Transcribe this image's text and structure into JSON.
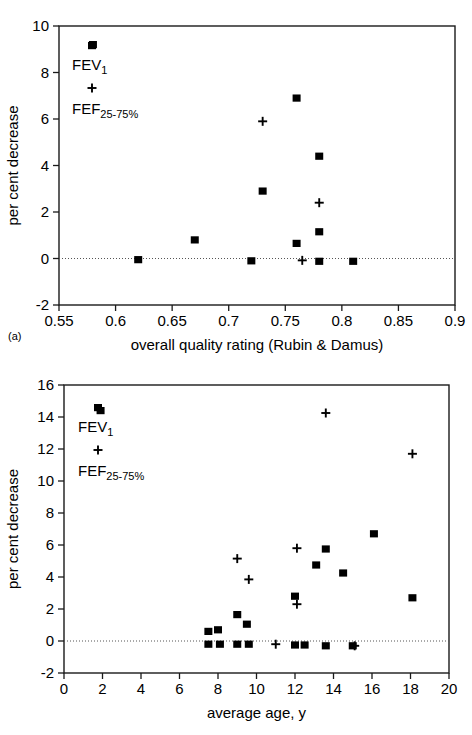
{
  "figure": {
    "panel_a_tag": "(a)",
    "panel_b_tag": "(b)"
  },
  "legend": {
    "series1_label": "FEV",
    "series1_sub": "1",
    "series2_label": "FEF",
    "series2_sub": "25-75%",
    "series1_marker": "filled-square",
    "series2_marker": "plus"
  },
  "chart_data": [
    {
      "type": "scatter",
      "panel": "(a)",
      "title": "",
      "xlabel": "overall quality rating (Rubin & Damus)",
      "ylabel": "per cent decrease",
      "xlim": [
        0.55,
        0.9
      ],
      "ylim": [
        -2,
        10
      ],
      "xticks": [
        0.55,
        0.6,
        0.65,
        0.7,
        0.75,
        0.8,
        0.85,
        0.9
      ],
      "xtick_labels": [
        "0.55",
        "0.6",
        "0.65",
        "0.7",
        "0.75",
        "0.8",
        "0.85",
        "0.9"
      ],
      "yticks": [
        -2,
        0,
        2,
        4,
        6,
        8,
        10
      ],
      "ytick_labels": [
        "-2",
        "0",
        "2",
        "4",
        "6",
        "8",
        "10"
      ],
      "grid": false,
      "zero_line": true,
      "legend_position": "top-left inside",
      "series": [
        {
          "name": "FEV1",
          "marker": "filled-square",
          "points": [
            {
              "x": 0.58,
              "y": 9.2
            },
            {
              "x": 0.62,
              "y": -0.05
            },
            {
              "x": 0.67,
              "y": 0.8
            },
            {
              "x": 0.72,
              "y": -0.1
            },
            {
              "x": 0.73,
              "y": 2.9
            },
            {
              "x": 0.76,
              "y": 6.9
            },
            {
              "x": 0.76,
              "y": 0.65
            },
            {
              "x": 0.78,
              "y": 4.4
            },
            {
              "x": 0.78,
              "y": 1.15
            },
            {
              "x": 0.78,
              "y": -0.12
            },
            {
              "x": 0.81,
              "y": -0.12
            }
          ]
        },
        {
          "name": "FEF25-75%",
          "marker": "plus",
          "points": [
            {
              "x": 0.73,
              "y": 5.9
            },
            {
              "x": 0.78,
              "y": 2.4
            },
            {
              "x": 0.765,
              "y": -0.08
            }
          ]
        }
      ]
    },
    {
      "type": "scatter",
      "panel": "(b)",
      "title": "",
      "xlabel": "average age, y",
      "ylabel": "per cent decrease",
      "xlim": [
        0,
        20
      ],
      "ylim": [
        -2,
        16
      ],
      "xticks": [
        0,
        2,
        4,
        6,
        8,
        10,
        12,
        14,
        16,
        18,
        20
      ],
      "xtick_labels": [
        "0",
        "2",
        "4",
        "6",
        "8",
        "10",
        "12",
        "14",
        "16",
        "18",
        "20"
      ],
      "yticks": [
        -2,
        0,
        2,
        4,
        6,
        8,
        10,
        12,
        14,
        16
      ],
      "ytick_labels": [
        "-2",
        "0",
        "2",
        "4",
        "6",
        "8",
        "10",
        "12",
        "14",
        "16"
      ],
      "grid": false,
      "zero_line": true,
      "legend_position": "top-left inside",
      "series": [
        {
          "name": "FEV1",
          "marker": "filled-square",
          "points": [
            {
              "x": 1.9,
              "y": 14.4
            },
            {
              "x": 7.5,
              "y": 0.6
            },
            {
              "x": 7.5,
              "y": -0.2
            },
            {
              "x": 8.0,
              "y": 0.7
            },
            {
              "x": 8.1,
              "y": -0.2
            },
            {
              "x": 9.0,
              "y": 1.65
            },
            {
              "x": 9.0,
              "y": -0.2
            },
            {
              "x": 9.5,
              "y": 1.05
            },
            {
              "x": 9.6,
              "y": -0.2
            },
            {
              "x": 12.0,
              "y": 2.8
            },
            {
              "x": 12.0,
              "y": -0.25
            },
            {
              "x": 12.5,
              "y": -0.25
            },
            {
              "x": 13.1,
              "y": 4.75
            },
            {
              "x": 13.6,
              "y": 5.75
            },
            {
              "x": 13.6,
              "y": -0.3
            },
            {
              "x": 14.5,
              "y": 4.25
            },
            {
              "x": 15.0,
              "y": -0.3
            },
            {
              "x": 16.1,
              "y": 6.7
            },
            {
              "x": 18.1,
              "y": 2.7
            }
          ]
        },
        {
          "name": "FEF25-75%",
          "marker": "plus",
          "points": [
            {
              "x": 9.0,
              "y": 5.15
            },
            {
              "x": 9.6,
              "y": 3.85
            },
            {
              "x": 11.0,
              "y": -0.2
            },
            {
              "x": 12.1,
              "y": 5.8
            },
            {
              "x": 12.1,
              "y": 2.3
            },
            {
              "x": 13.6,
              "y": 14.25
            },
            {
              "x": 15.1,
              "y": -0.3
            },
            {
              "x": 18.1,
              "y": 11.7
            }
          ]
        }
      ]
    }
  ]
}
